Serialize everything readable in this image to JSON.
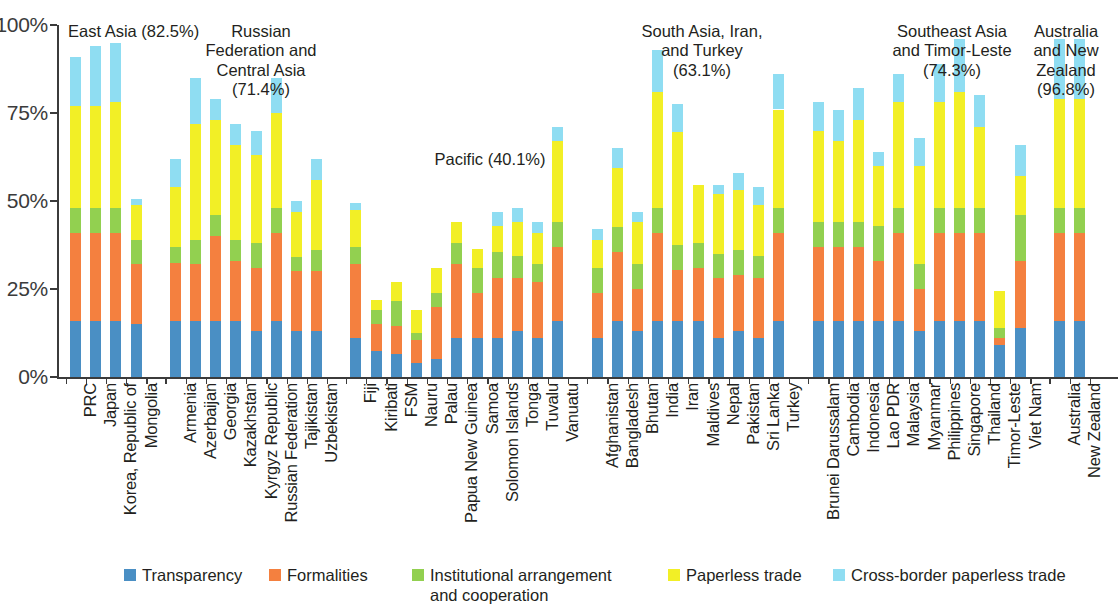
{
  "chart_data": {
    "type": "bar",
    "subtype": "stacked-bar",
    "title": "",
    "xlabel": "",
    "ylabel": "",
    "ylim": [
      0,
      100
    ],
    "ytick_labels": [
      "0%",
      "25%",
      "50%",
      "75%",
      "100%"
    ],
    "ytick_values": [
      0,
      25,
      50,
      75,
      100
    ],
    "grid": false,
    "legend_position": "bottom",
    "series": [
      {
        "name": "Transparency",
        "color": "#4a8fc4",
        "key": "transparency"
      },
      {
        "name": "Formalities",
        "color": "#f4803f",
        "key": "formalities"
      },
      {
        "name": "Institutional arrangement\nand cooperation",
        "color": "#92d050",
        "key": "institutional"
      },
      {
        "name": "Paperless trade",
        "color": "#f2ef26",
        "key": "paperless"
      },
      {
        "name": "Cross-border paperless trade",
        "color": "#8fddf2",
        "key": "crossborder"
      }
    ],
    "groups": [
      {
        "label": "East Asia (82.5%)",
        "name": "East Asia",
        "score": "82.5%",
        "countries": [
          {
            "name": "PRC",
            "values": [
              16.0,
              25.0,
              7.0,
              29.0,
              14.0
            ],
            "total": 91.0
          },
          {
            "name": "Japan",
            "values": [
              16.0,
              25.0,
              7.0,
              29.0,
              17.0
            ],
            "total": 94.0
          },
          {
            "name": "Korea, Republic of",
            "values": [
              16.0,
              25.0,
              7.0,
              30.0,
              17.0
            ],
            "total": 95.0
          },
          {
            "name": "Mongolia",
            "values": [
              15.0,
              17.0,
              7.0,
              10.0,
              1.5
            ],
            "total": 50.5
          }
        ]
      },
      {
        "label": "Russian\nFederation and\nCentral Asia\n(71.4%)",
        "name": "Russian Federation and Central Asia",
        "score": "71.4%",
        "countries": [
          {
            "name": "Armenia",
            "values": [
              16.0,
              16.5,
              4.5,
              17.0,
              8.0
            ],
            "total": 62.0
          },
          {
            "name": "Azerbaijan",
            "values": [
              16.0,
              16.0,
              7.0,
              33.0,
              13.0
            ],
            "total": 85.0
          },
          {
            "name": "Georgia",
            "values": [
              16.0,
              24.0,
              6.0,
              27.0,
              6.0
            ],
            "total": 79.0
          },
          {
            "name": "Kazakhstan",
            "values": [
              16.0,
              17.0,
              6.0,
              27.0,
              6.0
            ],
            "total": 72.0
          },
          {
            "name": "Kyrgyz Republic",
            "values": [
              13.0,
              18.0,
              7.0,
              25.0,
              7.0
            ],
            "total": 70.0
          },
          {
            "name": "Russian Federation",
            "values": [
              16.0,
              25.0,
              7.0,
              27.0,
              10.0
            ],
            "total": 85.0
          },
          {
            "name": "Tajikistan",
            "values": [
              13.0,
              17.0,
              4.0,
              13.0,
              3.0
            ],
            "total": 50.0
          },
          {
            "name": "Uzbekistan",
            "values": [
              13.0,
              17.0,
              6.0,
              20.0,
              6.0
            ],
            "total": 62.0
          }
        ]
      },
      {
        "label": "Pacific (40.1%)",
        "name": "Pacific",
        "score": "40.1%",
        "countries": [
          {
            "name": "Fiji",
            "values": [
              11.0,
              21.0,
              5.0,
              10.5,
              2.0
            ],
            "total": 49.5
          },
          {
            "name": "Kiribati",
            "values": [
              7.5,
              7.5,
              4.0,
              3.0,
              0.0
            ],
            "total": 22.0
          },
          {
            "name": "FSM",
            "values": [
              6.5,
              8.0,
              7.0,
              5.5,
              0.0
            ],
            "total": 27.0
          },
          {
            "name": "Nauru",
            "values": [
              4.0,
              6.5,
              2.0,
              6.5,
              0.0
            ],
            "total": 19.0
          },
          {
            "name": "Palau",
            "values": [
              5.0,
              15.0,
              4.0,
              7.0,
              0.0
            ],
            "total": 31.0
          },
          {
            "name": "Papua New Guinea",
            "values": [
              11.0,
              21.0,
              6.0,
              6.0,
              0.0
            ],
            "total": 44.0
          },
          {
            "name": "Samoa",
            "values": [
              11.0,
              13.0,
              7.0,
              5.5,
              0.0
            ],
            "total": 36.5
          },
          {
            "name": "Solomon Islands",
            "values": [
              11.0,
              17.0,
              7.5,
              7.5,
              4.0
            ],
            "total": 47.0
          },
          {
            "name": "Tonga",
            "values": [
              13.0,
              15.0,
              6.5,
              9.5,
              4.0
            ],
            "total": 48.0
          },
          {
            "name": "Tuvalu",
            "values": [
              11.0,
              16.0,
              5.0,
              9.0,
              3.0
            ],
            "total": 44.0
          },
          {
            "name": "Vanuatu",
            "values": [
              16.0,
              21.0,
              7.0,
              23.0,
              4.0
            ],
            "total": 71.0
          }
        ]
      },
      {
        "label": "South Asia, Iran,\nand Turkey\n(63.1%)",
        "name": "South Asia, Iran, and Turkey",
        "score": "63.1%",
        "countries": [
          {
            "name": "Afghanistan",
            "values": [
              11.0,
              13.0,
              7.0,
              8.0,
              3.0
            ],
            "total": 42.0
          },
          {
            "name": "Bangladesh",
            "values": [
              16.0,
              19.5,
              7.0,
              17.0,
              5.5
            ],
            "total": 65.0
          },
          {
            "name": "Bhutan",
            "values": [
              13.0,
              12.0,
              7.0,
              12.0,
              3.0
            ],
            "total": 47.0
          },
          {
            "name": "India",
            "values": [
              16.0,
              25.0,
              7.0,
              33.0,
              12.0
            ],
            "total": 93.0
          },
          {
            "name": "Iran",
            "values": [
              16.0,
              14.5,
              7.0,
              32.0,
              8.0
            ],
            "total": 77.5
          },
          {
            "name": "Maldives",
            "values": [
              16.0,
              15.0,
              7.0,
              16.5,
              0.0
            ],
            "total": 54.5
          },
          {
            "name": "Nepal",
            "values": [
              11.0,
              17.0,
              7.0,
              17.0,
              2.5
            ],
            "total": 54.5
          },
          {
            "name": "Pakistan",
            "values": [
              13.0,
              16.0,
              7.0,
              17.0,
              5.0
            ],
            "total": 58.0
          },
          {
            "name": "Sri Lanka",
            "values": [
              11.0,
              17.0,
              6.5,
              14.5,
              5.0
            ],
            "total": 54.0
          },
          {
            "name": "Turkey",
            "values": [
              16.0,
              25.0,
              7.0,
              28.0,
              10.0
            ],
            "total": 86.0
          }
        ]
      },
      {
        "label": "Southeast Asia\nand Timor-Leste\n(74.3%)",
        "name": "Southeast Asia and Timor-Leste",
        "score": "74.3%",
        "countries": [
          {
            "name": "Brunei Darussalam",
            "values": [
              16.0,
              21.0,
              7.0,
              26.0,
              8.0
            ],
            "total": 78.0
          },
          {
            "name": "Cambodia",
            "values": [
              16.0,
              21.0,
              7.0,
              23.0,
              9.0
            ],
            "total": 76.0
          },
          {
            "name": "Indonesia",
            "values": [
              16.0,
              21.0,
              7.0,
              29.0,
              9.0
            ],
            "total": 82.0
          },
          {
            "name": "Lao PDR",
            "values": [
              16.0,
              17.0,
              10.0,
              17.0,
              4.0
            ],
            "total": 64.0
          },
          {
            "name": "Malaysia",
            "values": [
              16.0,
              25.0,
              7.0,
              30.0,
              8.0
            ],
            "total": 86.0
          },
          {
            "name": "Myanmar",
            "values": [
              13.0,
              12.0,
              7.0,
              28.0,
              8.0
            ],
            "total": 68.0
          },
          {
            "name": "Philippines",
            "values": [
              16.0,
              25.0,
              7.0,
              30.0,
              11.0
            ],
            "total": 89.0
          },
          {
            "name": "Singapore",
            "values": [
              16.0,
              25.0,
              7.0,
              33.0,
              15.0
            ],
            "total": 96.0
          },
          {
            "name": "Thailand",
            "values": [
              16.0,
              25.0,
              7.0,
              23.0,
              9.0
            ],
            "total": 80.0
          },
          {
            "name": "Timor-Leste",
            "values": [
              9.0,
              2.0,
              3.0,
              10.5,
              0.0
            ],
            "total": 24.5
          },
          {
            "name": "Viet Nam",
            "values": [
              14.0,
              19.0,
              13.0,
              11.0,
              9.0
            ],
            "total": 66.0
          }
        ]
      },
      {
        "label": "Australia\nand New\nZealand\n(96.8%)",
        "name": "Australia and New Zealand",
        "score": "96.8%",
        "countries": [
          {
            "name": "Australia",
            "values": [
              16.0,
              25.0,
              7.0,
              31.0,
              17.0
            ],
            "total": 96.0
          },
          {
            "name": "New Zealand",
            "values": [
              16.0,
              25.0,
              7.0,
              31.0,
              17.0
            ],
            "total": 96.0
          }
        ]
      }
    ]
  },
  "legend": {
    "items": [
      {
        "label": "Transparency",
        "color": "#4a8fc4",
        "x": 124
      },
      {
        "label": "Formalities",
        "color": "#f4803f",
        "x": 269
      },
      {
        "label": "Institutional arrangement\nand cooperation",
        "color": "#92d050",
        "x": 412
      },
      {
        "label": "Paperless trade",
        "color": "#f2ef26",
        "x": 668
      },
      {
        "label": "Cross-border paperless trade",
        "color": "#8fddf2",
        "x": 833
      }
    ]
  }
}
